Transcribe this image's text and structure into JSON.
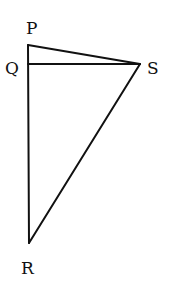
{
  "diagram": {
    "type": "geometry",
    "points": {
      "P": {
        "label": "P",
        "x": 28,
        "y": 45,
        "label_x": 26,
        "label_y": 34
      },
      "Q": {
        "label": "Q",
        "x": 28,
        "y": 64,
        "label_x": 5,
        "label_y": 74
      },
      "S": {
        "label": "S",
        "x": 140,
        "y": 64,
        "label_x": 147,
        "label_y": 74
      },
      "R": {
        "label": "R",
        "x": 29,
        "y": 243,
        "label_x": 21,
        "label_y": 274
      }
    },
    "segments": [
      {
        "from": "P",
        "to": "S"
      },
      {
        "from": "Q",
        "to": "S"
      },
      {
        "from": "P",
        "to": "R"
      },
      {
        "from": "S",
        "to": "R"
      }
    ],
    "colors": {
      "stroke": "#111111",
      "background": "#ffffff"
    }
  }
}
